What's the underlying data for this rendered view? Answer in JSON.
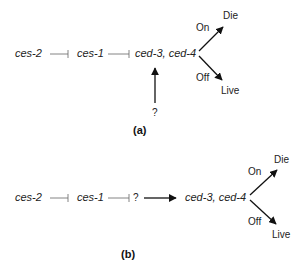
{
  "panel_a": {
    "label": "(a)",
    "nodes": {
      "ces2": "ces-2",
      "ces1": "ces-1",
      "ced": "ced-3, ced-4",
      "unknown": "?"
    },
    "edges": [
      {
        "from": "ces-2",
        "to": "ces-1",
        "type": "inhibits"
      },
      {
        "from": "ces-1",
        "to": "ced-3, ced-4",
        "type": "inhibits"
      },
      {
        "from": "?",
        "to": "ced-3, ced-4",
        "type": "activates"
      }
    ],
    "branch": {
      "on_label": "On",
      "on_outcome": "Die",
      "off_label": "Off",
      "off_outcome": "Live"
    }
  },
  "panel_b": {
    "label": "(b)",
    "nodes": {
      "ces2": "ces-2",
      "ces1": "ces-1",
      "unknown": "?",
      "ced": "ced-3, ced-4"
    },
    "edges": [
      {
        "from": "ces-2",
        "to": "ces-1",
        "type": "inhibits"
      },
      {
        "from": "ces-1",
        "to": "?",
        "type": "inhibits"
      },
      {
        "from": "?",
        "to": "ced-3, ced-4",
        "type": "activates"
      }
    ],
    "branch": {
      "on_label": "On",
      "on_outcome": "Die",
      "off_label": "Off",
      "off_outcome": "Live"
    }
  },
  "colors": {
    "line": "#222222",
    "inhibit_line": "#666666",
    "background": "#ffffff"
  }
}
